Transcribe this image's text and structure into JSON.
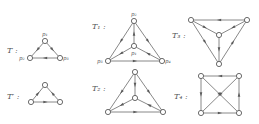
{
  "graphs": [
    {
      "id": "T",
      "label": "T :",
      "label_pos": [
        7,
        53
      ],
      "nodes": [
        {
          "id": "p1",
          "label": "p₁",
          "x": 45,
          "y": 41,
          "lx": 42,
          "ly": 36
        },
        {
          "id": "p2",
          "label": "p₂",
          "x": 30,
          "y": 58,
          "lx": 19,
          "ly": 60
        },
        {
          "id": "p3",
          "label": "p₃",
          "x": 60,
          "y": 58,
          "lx": 63,
          "ly": 60
        }
      ],
      "edges": [
        [
          "p1",
          "p2"
        ],
        [
          "p1",
          "p3"
        ],
        [
          "p3",
          "p2"
        ]
      ]
    },
    {
      "id": "T'",
      "label": "T′ :",
      "label_pos": [
        7,
        99
      ],
      "nodes": [
        {
          "id": "a",
          "label": "",
          "x": 45,
          "y": 85
        },
        {
          "id": "b",
          "label": "",
          "x": 31,
          "y": 102
        },
        {
          "id": "c",
          "label": "",
          "x": 60,
          "y": 102
        }
      ],
      "edges": [
        [
          "b",
          "a"
        ],
        [
          "c",
          "a"
        ],
        [
          "b",
          "c"
        ]
      ]
    },
    {
      "id": "T1",
      "label": "T₁ :",
      "label_pos": [
        92,
        29
      ],
      "nodes": [
        {
          "id": "p2",
          "label": "p₂",
          "x": 134,
          "y": 21,
          "lx": 131,
          "ly": 16
        },
        {
          "id": "p1",
          "label": "p₁",
          "x": 134,
          "y": 46,
          "lx": 131,
          "ly": 55
        },
        {
          "id": "p3",
          "label": "p₃",
          "x": 108,
          "y": 61,
          "lx": 97,
          "ly": 63
        },
        {
          "id": "p4",
          "label": "p₄",
          "x": 162,
          "y": 61,
          "lx": 165,
          "ly": 63
        }
      ],
      "edges": [
        [
          "p1",
          "p2"
        ],
        [
          "p2",
          "p3"
        ],
        [
          "p2",
          "p4"
        ],
        [
          "p1",
          "p3"
        ],
        [
          "p4",
          "p1"
        ],
        [
          "p3",
          "p4"
        ]
      ]
    },
    {
      "id": "T2",
      "label": "T₂ :",
      "label_pos": [
        92,
        91
      ],
      "nodes": [
        {
          "id": "a",
          "label": "",
          "x": 135,
          "y": 72
        },
        {
          "id": "b",
          "label": "",
          "x": 135,
          "y": 98
        },
        {
          "id": "c",
          "label": "",
          "x": 108,
          "y": 112
        },
        {
          "id": "d",
          "label": "",
          "x": 163,
          "y": 112
        }
      ],
      "edges": [
        [
          "a",
          "b"
        ],
        [
          "a",
          "c"
        ],
        [
          "a",
          "d"
        ],
        [
          "b",
          "c"
        ],
        [
          "d",
          "b"
        ],
        [
          "c",
          "d"
        ]
      ]
    },
    {
      "id": "T3",
      "label": "T₃ :",
      "label_pos": [
        172,
        38
      ],
      "nodes": [
        {
          "id": "a",
          "label": "",
          "x": 191,
          "y": 20
        },
        {
          "id": "b",
          "label": "",
          "x": 247,
          "y": 20
        },
        {
          "id": "c",
          "label": "",
          "x": 219,
          "y": 35
        },
        {
          "id": "d",
          "label": "",
          "x": 219,
          "y": 64
        }
      ],
      "edges": [
        [
          "b",
          "a"
        ],
        [
          "a",
          "c"
        ],
        [
          "b",
          "c"
        ],
        [
          "c",
          "d"
        ],
        [
          "a",
          "d"
        ],
        [
          "d",
          "b"
        ]
      ]
    },
    {
      "id": "T4",
      "label": "T₄ :",
      "label_pos": [
        174,
        99
      ],
      "nodes": [
        {
          "id": "a",
          "label": "",
          "x": 201,
          "y": 76
        },
        {
          "id": "b",
          "label": "",
          "x": 239,
          "y": 76
        },
        {
          "id": "c",
          "label": "",
          "x": 201,
          "y": 113
        },
        {
          "id": "d",
          "label": "",
          "x": 239,
          "y": 113
        }
      ],
      "edges": [
        [
          "b",
          "a"
        ],
        [
          "a",
          "c"
        ],
        [
          "d",
          "b"
        ],
        [
          "c",
          "d"
        ],
        [
          "a",
          "d"
        ],
        [
          "b",
          "c"
        ]
      ]
    }
  ],
  "style": {
    "edge_color": "#6a6a6a",
    "node_stroke": "#5a5a5a",
    "text_color": "#555555"
  }
}
